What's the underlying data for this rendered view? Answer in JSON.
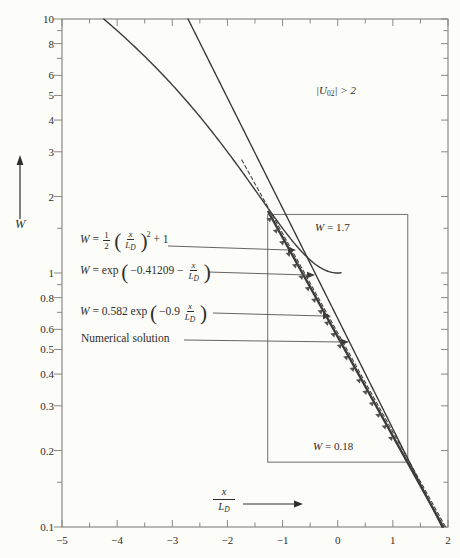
{
  "figure": {
    "bg": "#fcfcf9",
    "ink": "#3e3c39",
    "frame": "#8b8984",
    "box_color": "#7d7b76",
    "pointer_color": "#55534f"
  },
  "axes": {
    "y_arrow_label": "W",
    "x_label": {
      "num": "x",
      "den_main": "L",
      "den_sub": "D"
    },
    "x_tick_labels": [
      "−5",
      "−4",
      "−3",
      "−2",
      "−1",
      "0",
      "1",
      "2"
    ],
    "x_tick_values": [
      -5,
      -4,
      -3,
      -2,
      -1,
      0,
      1,
      2
    ],
    "x_minor_values": [
      -4.5,
      -3.5,
      -2.5,
      -1.5,
      -0.5,
      0.5,
      1.5
    ],
    "y_tick_labels": [
      "10",
      "8",
      "6",
      "5",
      "4",
      "3",
      "2",
      "1",
      "0.8",
      "0.6",
      "0.5",
      "0.4",
      "0.3",
      "0.2",
      "0.1"
    ],
    "y_tick_values": [
      10,
      8,
      6,
      5,
      4,
      3,
      2,
      1,
      0.8,
      0.6,
      0.5,
      0.4,
      0.3,
      0.2,
      0.1
    ],
    "y_minor_values": [
      9,
      7,
      1.5,
      0.9,
      0.7,
      0.15
    ]
  },
  "chart_data": {
    "type": "line",
    "x_axis": {
      "label": "x/L_D",
      "min": -5,
      "max": 2,
      "major_tick_step": 1,
      "minor_tick_step": 0.5
    },
    "y_axis": {
      "label": "W",
      "scale": "log",
      "min": 0.1,
      "max": 10
    },
    "series": [
      {
        "name": "parabolic approximation",
        "formula": "W = (1/2)(x/L_D)^2 + 1",
        "kind": "parabola",
        "params": {
          "a": 0.5,
          "c": 1
        },
        "domain": [
          -4.243,
          0.06
        ],
        "style": "solid",
        "width": 1.4
      },
      {
        "name": "exponential solution",
        "formula": "W = exp(-0.41209 - x/L_D)",
        "kind": "exp",
        "params": {
          "A": 0.66222,
          "k": 1
        },
        "domain": [
          -2.715,
          1.893
        ],
        "style": "solid",
        "width": 1.4
      },
      {
        "name": "exponential approximation",
        "formula": "W = 0.582 exp(-0.9 x/L_D)",
        "kind": "exp",
        "params": {
          "A": 0.582,
          "k": 0.9
        },
        "domain": [
          -1.74,
          1.955
        ],
        "style": "dashed",
        "width": 1.05
      },
      {
        "name": "numerical solution",
        "formula": "numerical",
        "kind": "exp",
        "params": {
          "A": 0.561,
          "k": 0.9
        },
        "domain": [
          -1.26,
          1.912
        ],
        "style": "solid",
        "width": 2.3,
        "teeth": true,
        "teeth_domain": [
          -1.2,
          1.12
        ]
      }
    ],
    "highlight_box": {
      "x1": -1.27,
      "x2": 1.27,
      "w_top": 1.7,
      "w_bottom": 0.18
    },
    "condition_annotation": "|U_02| > 2",
    "box_labels": {
      "top": "W = 1.7",
      "bottom": "W = 0.18"
    }
  },
  "labels": {
    "eq1": {
      "wvar": "W",
      "rel": "=",
      "fr1n": "1",
      "fr1d": "2",
      "open": "(",
      "fr2n": "x",
      "fr2dm": "L",
      "fr2ds": "D",
      "close": ")",
      "power": "2",
      "tail": "+ 1"
    },
    "eq2": {
      "wvar": "W",
      "rel": "= exp",
      "open": "(",
      "mid": "−0.41209 −",
      "frn": "x",
      "frdm": "L",
      "frds": "D",
      "close": ")"
    },
    "eq3": {
      "wvar": "W",
      "rel": "= 0.582 exp",
      "open": "(",
      "mid": "−0.9",
      "frn": "x",
      "frdm": "L",
      "frds": "D",
      "close": ")"
    },
    "eq4": "Numerical solution",
    "u02": {
      "pre": "|U",
      "sub": "02",
      "post": "| > 2"
    },
    "w_top": {
      "wvar": "W",
      "rest": "= 1.7"
    },
    "w_bottom": {
      "wvar": "W",
      "rest": "= 0.18"
    }
  },
  "pointers": [
    {
      "x1": 168,
      "y1": 246,
      "x2": 289,
      "y2": 250
    },
    {
      "x1": 208,
      "y1": 272,
      "x2": 308,
      "y2": 275
    },
    {
      "x1": 213,
      "y1": 313,
      "x2": 324,
      "y2": 316
    },
    {
      "x1": 184,
      "y1": 340,
      "x2": 342,
      "y2": 342
    }
  ]
}
